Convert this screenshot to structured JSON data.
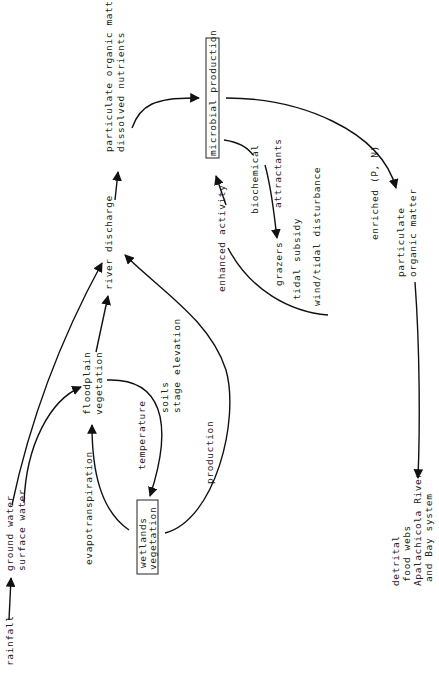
{
  "diagram": {
    "orientation": "rotated-90-ccw",
    "nodes": {
      "rainfall": "rainfall",
      "ground_water": "ground water",
      "surface_water": "surface water",
      "floodplain_line1": "floodplain",
      "floodplain_line2": "vegetation",
      "wetlands_line1": "wetlands",
      "wetlands_line2": "vegetation",
      "river_discharge": "river discharge",
      "pom_line1": "particulate organic matter",
      "pom_line2": "dissolved nutrients",
      "microbial_production": "microbial production",
      "enriched": "enriched (P, N)",
      "particulate_line1": "particulate",
      "particulate_line2": "organic matter",
      "detrital_line1": "detrital",
      "detrital_line2": "food webs",
      "detrital_line3": "Apalachicola River",
      "detrital_line4": "and Bay system"
    },
    "edge_labels": {
      "evapotranspiration": "evapotranspiration",
      "temperature": "temperature",
      "soils": "soils",
      "stage_elevation": "stage elevation",
      "production": "production",
      "enhanced_activity": "enhanced activity",
      "biochemical": "biochemical",
      "attractants": "attractants",
      "grazers": "grazers",
      "tidal_subsidy": "tidal subsidy",
      "wind_tidal": "wind/tidal disturbance"
    },
    "colors": {
      "background": "#ffffff",
      "ink": "#111111"
    }
  }
}
